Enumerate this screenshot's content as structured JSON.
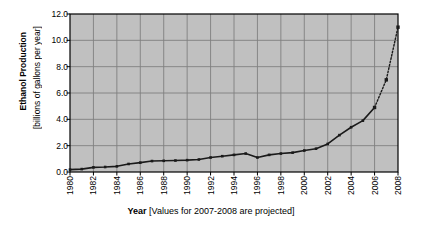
{
  "chart_data": {
    "type": "line",
    "title": "",
    "xlabel": "Year [Values for 2007-2008 are projected]",
    "xlabel_bold_part": "Year",
    "xlabel_rest": " [Values for 2007-2008 are projected]",
    "ylabel": "Ethanol Production",
    "ylabel_sub": "[billions of gallons per year]",
    "ylim": [
      0.0,
      12.0
    ],
    "xlim": [
      1980,
      2008
    ],
    "ytick_labels": [
      "12.0",
      "10.0",
      "8.0",
      "6.0",
      "4.0",
      "2.0",
      "0.0"
    ],
    "ytick_values": [
      12.0,
      10.0,
      8.0,
      6.0,
      4.0,
      2.0,
      0.0
    ],
    "xtick_labels": [
      "1980",
      "1982",
      "1984",
      "1986",
      "1988",
      "1990",
      "1992",
      "1994",
      "1996",
      "1998",
      "2000",
      "2002",
      "2004",
      "2006",
      "2008"
    ],
    "xtick_values": [
      1980,
      1982,
      1984,
      1986,
      1988,
      1990,
      1992,
      1994,
      1996,
      1998,
      2000,
      2002,
      2004,
      2006,
      2008
    ],
    "grid": true,
    "legend": "none",
    "plot_background": "#c0c0c0",
    "grid_color": "#808080",
    "line_color": "#1a1a1a",
    "marker": "square",
    "x": [
      1980,
      1981,
      1982,
      1983,
      1984,
      1985,
      1986,
      1987,
      1988,
      1989,
      1990,
      1991,
      1992,
      1993,
      1994,
      1995,
      1996,
      1997,
      1998,
      1999,
      2000,
      2001,
      2002,
      2003,
      2004,
      2005,
      2006,
      2007,
      2008
    ],
    "values": [
      0.18,
      0.22,
      0.35,
      0.38,
      0.43,
      0.61,
      0.71,
      0.83,
      0.85,
      0.87,
      0.9,
      0.95,
      1.1,
      1.2,
      1.3,
      1.4,
      1.1,
      1.3,
      1.4,
      1.47,
      1.63,
      1.77,
      2.13,
      2.8,
      3.4,
      3.9,
      4.9,
      7.0,
      11.0
    ],
    "series": [
      {
        "name": "Ethanol production (actual)",
        "style": "solid",
        "x": [
          1980,
          1981,
          1982,
          1983,
          1984,
          1985,
          1986,
          1987,
          1988,
          1989,
          1990,
          1991,
          1992,
          1993,
          1994,
          1995,
          1996,
          1997,
          1998,
          1999,
          2000,
          2001,
          2002,
          2003,
          2004,
          2005,
          2006
        ],
        "values": [
          0.18,
          0.22,
          0.35,
          0.38,
          0.43,
          0.61,
          0.71,
          0.83,
          0.85,
          0.87,
          0.9,
          0.95,
          1.1,
          1.2,
          1.3,
          1.4,
          1.1,
          1.3,
          1.4,
          1.47,
          1.63,
          1.77,
          2.13,
          2.8,
          3.4,
          3.9,
          4.9
        ]
      },
      {
        "name": "Ethanol production (projected)",
        "style": "dotted",
        "x": [
          2006,
          2007,
          2008
        ],
        "values": [
          4.9,
          7.0,
          11.0
        ]
      }
    ],
    "annotations": [
      "Values for 2007-2008 are projected"
    ]
  }
}
